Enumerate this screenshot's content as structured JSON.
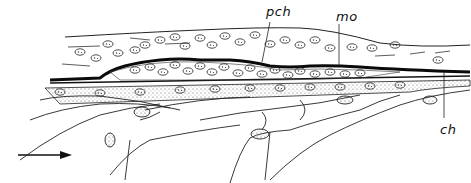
{
  "figure": {
    "type": "histological-section-drawing",
    "labels": {
      "pch": "pch",
      "mo": "mo",
      "ch": "ch"
    },
    "arrow": {
      "direction": "right"
    },
    "colors": {
      "ink": "#111111",
      "background": "#ffffff",
      "band": "#0a0a0a"
    }
  }
}
